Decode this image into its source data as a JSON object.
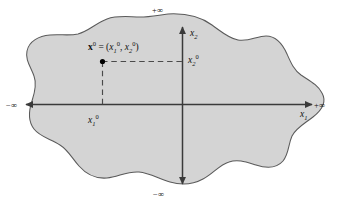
{
  "figure": {
    "type": "math-diagram",
    "colors": {
      "background": "#ffffff",
      "region_fill": "#d4d4d4",
      "region_stroke": "#5a5a5a",
      "axis": "#3a3a3a",
      "dashed_guide": "#4a4a4a",
      "point": "#000000",
      "text": "#111111"
    }
  },
  "axes": {
    "horizontal": {
      "name": "x1",
      "label_html": "x<sub>1</sub>",
      "positive_end_label": "+∞",
      "negative_end_label": "−∞",
      "arrowheads": "both"
    },
    "vertical": {
      "name": "x2",
      "label_html": "x<sub>2</sub>",
      "positive_end_label": "+∞",
      "negative_end_label": "−∞",
      "arrowheads": "both"
    }
  },
  "point": {
    "label_html": "<span class=\"vecbold\">x</span><sup>0</sup> = (<span class=\"ital\">x</span><sub>1</sub><sup>0</sup>, <span class=\"ital\">x</span><sub>2</sub><sup>0</sup>)",
    "marker": "filled-circle",
    "coordinate_labels": {
      "x1_projection_html": "x<sub>1</sub><sup>0</sup>",
      "x2_projection_html": "x<sub>2</sub><sup>0</sup>"
    },
    "guides": "dashed lines from the point to each axis"
  },
  "region": {
    "name": "feasible-region",
    "style": "shaded irregular closed curve (cloud/blob shape) spanning all four quadrants"
  }
}
